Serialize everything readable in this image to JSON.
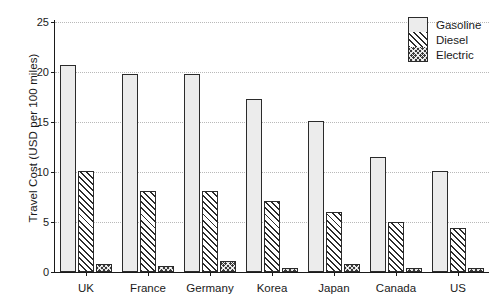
{
  "chart_data": {
    "type": "bar",
    "title": "",
    "xlabel": "",
    "ylabel": "Travel Cost (USD per 100 miles)",
    "ylim": [
      0,
      25
    ],
    "yticks": [
      0,
      5,
      10,
      15,
      20,
      25
    ],
    "grid": true,
    "legend_position": "top-right",
    "categories": [
      "UK",
      "France",
      "Germany",
      "Korea",
      "Japan",
      "Canada",
      "US"
    ],
    "series": [
      {
        "name": "Gasoline",
        "values": [
          20.7,
          19.8,
          19.8,
          17.3,
          15.1,
          11.5,
          10.1
        ]
      },
      {
        "name": "Diesel",
        "values": [
          10.1,
          8.1,
          8.1,
          7.1,
          6.0,
          5.0,
          4.4
        ]
      },
      {
        "name": "Electric",
        "values": [
          0.8,
          0.6,
          1.1,
          0.4,
          0.85,
          0.4,
          0.45
        ]
      }
    ]
  },
  "style": {
    "gasoline_color": "#ececec",
    "diesel_color": "#ffffff",
    "electric_color": "#3a3a3a",
    "axis_color": "#1a1a1a",
    "grid_color": "#b9b9b9",
    "background": "#ffffff"
  }
}
